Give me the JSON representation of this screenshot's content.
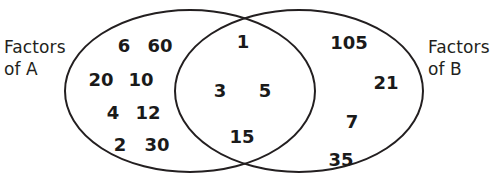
{
  "diagram": {
    "type": "venn-two-set",
    "title": "",
    "background_color": "#ffffff",
    "outline_color": "#231f20",
    "text_color": "#1a1a1a"
  },
  "labels": {
    "left_set": "Factors\nof A",
    "right_set": "Factors\nof B"
  },
  "regions": {
    "left_only": {
      "name": "Factors of A only",
      "members": [
        {
          "value": "6",
          "x": 124,
          "y": 46
        },
        {
          "value": "60",
          "x": 160,
          "y": 46
        },
        {
          "value": "20",
          "x": 101,
          "y": 80
        },
        {
          "value": "10",
          "x": 141,
          "y": 80
        },
        {
          "value": "4",
          "x": 113,
          "y": 113
        },
        {
          "value": "12",
          "x": 148,
          "y": 113
        },
        {
          "value": "2",
          "x": 120,
          "y": 145
        },
        {
          "value": "30",
          "x": 157,
          "y": 145
        }
      ]
    },
    "intersection": {
      "name": "Common factors of A and B",
      "members": [
        {
          "value": "1",
          "x": 243,
          "y": 42
        },
        {
          "value": "3",
          "x": 220,
          "y": 91
        },
        {
          "value": "5",
          "x": 265,
          "y": 91
        },
        {
          "value": "15",
          "x": 242,
          "y": 137
        }
      ]
    },
    "right_only": {
      "name": "Factors of B only",
      "members": [
        {
          "value": "105",
          "x": 349,
          "y": 43
        },
        {
          "value": "21",
          "x": 386,
          "y": 83
        },
        {
          "value": "7",
          "x": 352,
          "y": 122
        },
        {
          "value": "35",
          "x": 341,
          "y": 160
        }
      ]
    }
  },
  "shapes": {
    "left_ellipse": {
      "cx": 190,
      "cy": 91,
      "rx": 125,
      "ry": 81
    },
    "right_ellipse": {
      "cx": 299,
      "cy": 91,
      "rx": 124,
      "ry": 81
    },
    "stroke_width": 2
  }
}
